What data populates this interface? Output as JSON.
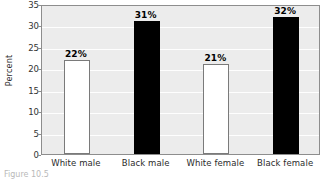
{
  "chart_data": {
    "type": "bar",
    "title": "",
    "xlabel": "",
    "ylabel": "Percent",
    "categories": [
      "White male",
      "Black male",
      "White female",
      "Black female"
    ],
    "values": [
      22,
      31,
      21,
      32
    ],
    "value_labels": [
      "22%",
      "31%",
      "21%",
      "32%"
    ],
    "bar_colors": [
      "#ffffff",
      "#000000",
      "#ffffff",
      "#000000"
    ],
    "ylim": [
      0,
      35
    ],
    "ytick_values": [
      0,
      5,
      10,
      15,
      20,
      25,
      30,
      35
    ],
    "ytick_labels": [
      "0",
      "5",
      "10",
      "15",
      "20",
      "25",
      "30",
      "35"
    ],
    "grid": true,
    "grid_axis": "y",
    "legend": false,
    "plot_background": "#ececec",
    "axis_color": "#8d8d8d"
  },
  "caption": {
    "text": "Figure 10.5"
  }
}
